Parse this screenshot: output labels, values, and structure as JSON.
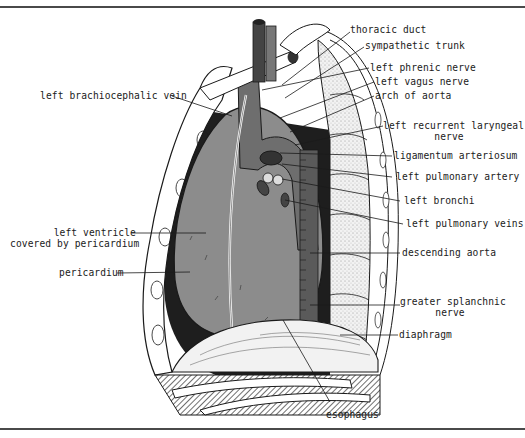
{
  "figure": {
    "colors": {
      "background": "#ffffff",
      "frame_rule": "#4a4a4a",
      "heart_fill": "#8c8c8c",
      "great_vessels": "#6e6e6e",
      "lung_space_dark": "#1e1e1e",
      "vertebra_stipple": "#e8e8e8",
      "line": "#1a1a1a"
    },
    "artist_initials": "wmr"
  },
  "labels": {
    "right": [
      {
        "id": "thoracic-duct",
        "text": "thoracic duct"
      },
      {
        "id": "sympathetic-trunk",
        "text": "sympathetic trunk"
      },
      {
        "id": "left-phrenic-nerve",
        "text": "left phrenic nerve"
      },
      {
        "id": "left-vagus-nerve",
        "text": "left vagus nerve"
      },
      {
        "id": "arch-of-aorta",
        "text": "arch of aorta"
      },
      {
        "id": "left-recurrent-laryngeal-nerve",
        "line1": "left recurrent laryngeal",
        "line2": "nerve"
      },
      {
        "id": "ligamentum-arteriosum",
        "text": "ligamentum arteriosum"
      },
      {
        "id": "left-pulmonary-artery",
        "text": "left pulmonary artery"
      },
      {
        "id": "left-bronchi",
        "text": "left bronchi"
      },
      {
        "id": "left-pulmonary-veins",
        "text": "left pulmonary veins"
      },
      {
        "id": "descending-aorta",
        "text": "descending aorta"
      },
      {
        "id": "greater-splanchnic-nerve",
        "line1": "greater splanchnic",
        "line2": "nerve"
      },
      {
        "id": "diaphragm",
        "text": "diaphragm"
      }
    ],
    "left": [
      {
        "id": "left-brachiocephalic-vein",
        "text": "left brachiocephalic vein"
      },
      {
        "id": "left-ventricle",
        "line1": "left ventricle",
        "line2": "covered by pericardium"
      },
      {
        "id": "pericardium",
        "text": "pericardium"
      }
    ],
    "bottom": [
      {
        "id": "esophagus",
        "text": "esophagus"
      }
    ]
  }
}
